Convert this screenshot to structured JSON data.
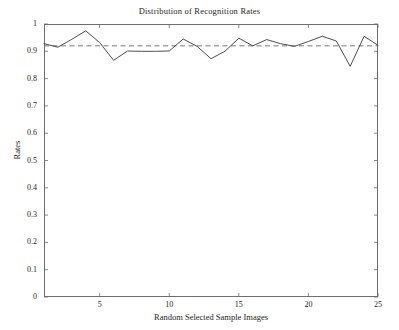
{
  "chart_data": {
    "type": "line",
    "title": "Distribution of Recognition Rates",
    "xlabel": "Random Selected Sample Images",
    "ylabel": "Rates",
    "xlim": [
      1,
      25
    ],
    "ylim": [
      0,
      1
    ],
    "grid": false,
    "legend": null,
    "xticks": [
      5,
      10,
      15,
      20,
      25
    ],
    "xtick_labels": [
      "5",
      "10",
      "15",
      "20",
      "25"
    ],
    "yticks": [
      0,
      0.1,
      0.2,
      0.3,
      0.4,
      0.5,
      0.6,
      0.7,
      0.8,
      0.9,
      1
    ],
    "ytick_labels": [
      "0",
      "0.1",
      "0.2",
      "0.3",
      "0.4",
      "0.5",
      "0.6",
      "0.7",
      "0.8",
      "0.9",
      "1"
    ],
    "x": [
      1,
      2,
      3,
      4,
      5,
      6,
      7,
      8,
      9,
      10,
      11,
      12,
      13,
      14,
      15,
      16,
      17,
      18,
      19,
      20,
      21,
      22,
      23,
      24,
      25
    ],
    "series": [
      {
        "name": "Recognition Rate",
        "style": "solid",
        "color": "#3a3a3a",
        "values": [
          0.928,
          0.915,
          0.944,
          0.975,
          0.932,
          0.867,
          0.901,
          0.9,
          0.9,
          0.901,
          0.945,
          0.918,
          0.873,
          0.9,
          0.948,
          0.92,
          0.943,
          0.928,
          0.918,
          0.936,
          0.955,
          0.938,
          0.845,
          0.955,
          0.922
        ]
      },
      {
        "name": "Mean Rate",
        "style": "dashed",
        "color": "#6b6b6b",
        "constant": 0.92
      }
    ]
  },
  "figure": {
    "background": "#ffffff",
    "axis_color": "#6e6e6e",
    "text_color": "#262626"
  }
}
